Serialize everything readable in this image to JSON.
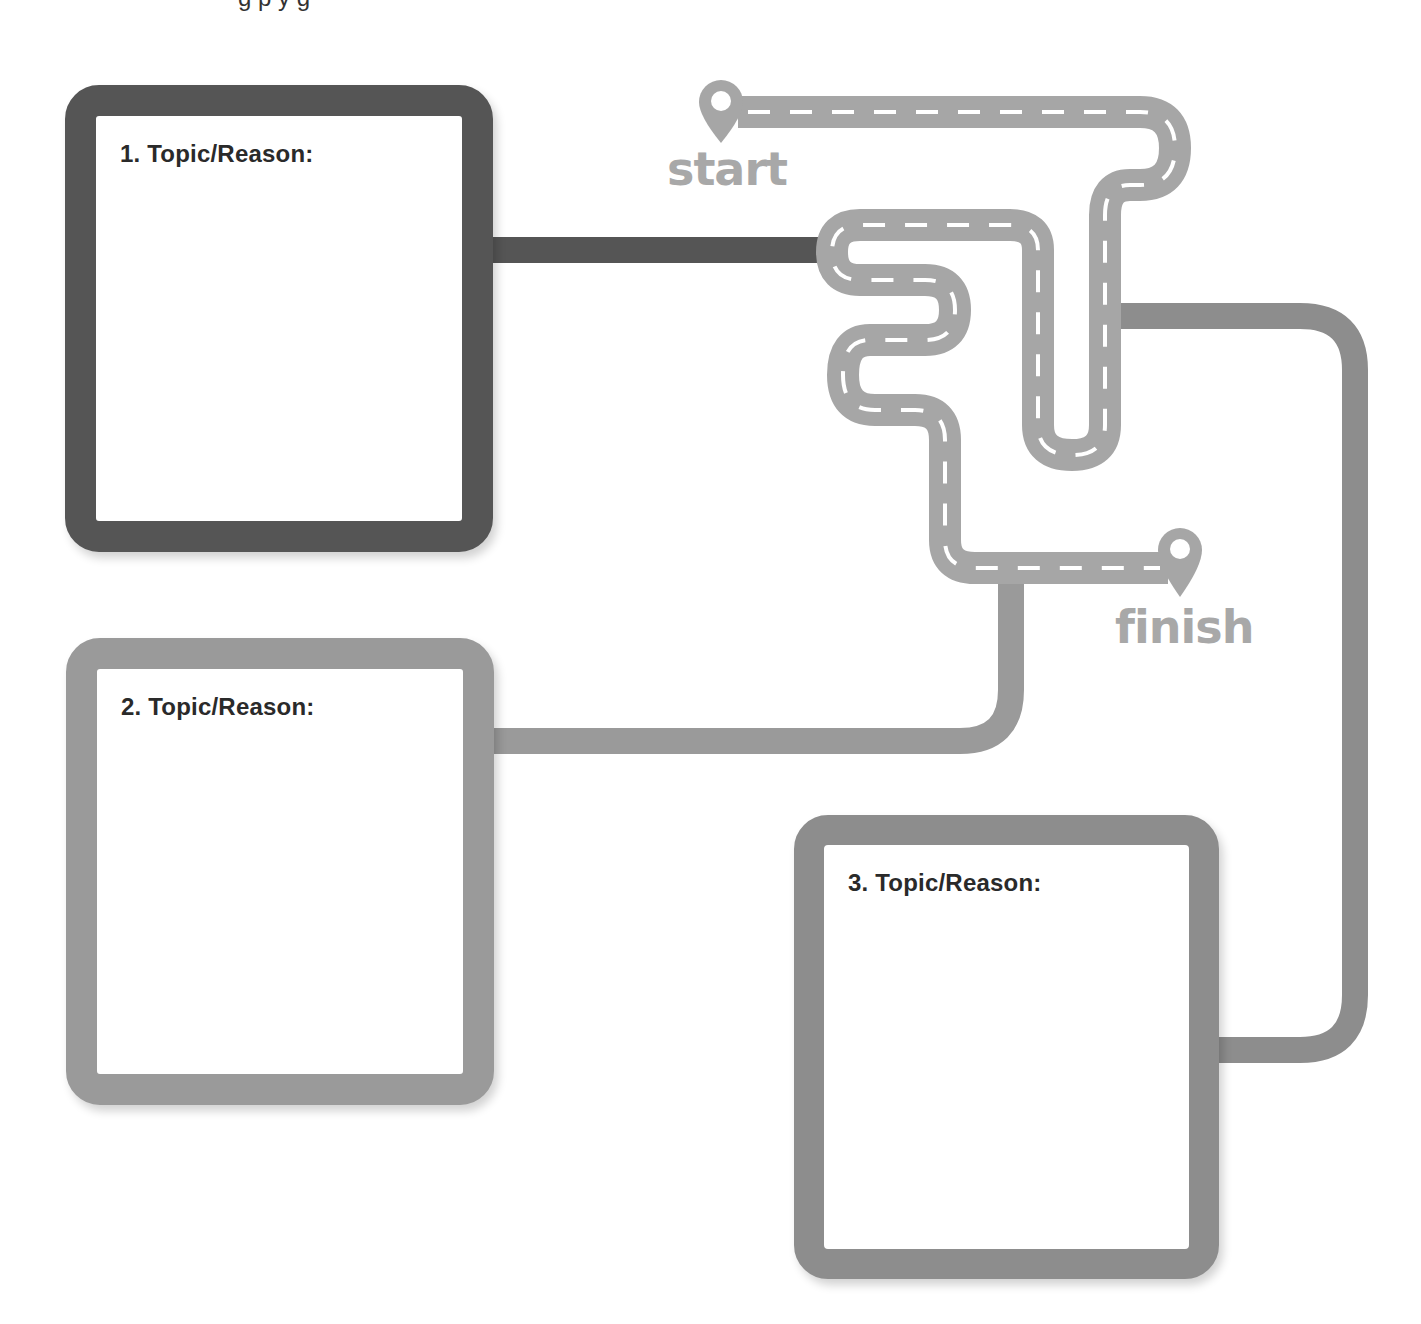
{
  "page": {
    "top_clipped_text": "g        p y          g"
  },
  "route": {
    "start_label": "start",
    "finish_label": "finish",
    "road_color": "#a6a6a6",
    "lane_marking_color": "#ffffff"
  },
  "boxes": [
    {
      "number": 1,
      "label": "1. Topic/Reason:",
      "border_color": "#555555"
    },
    {
      "number": 2,
      "label": "2. Topic/Reason:",
      "border_color": "#9a9a9a"
    },
    {
      "number": 3,
      "label": "3. Topic/Reason:",
      "border_color": "#8d8d8d"
    }
  ],
  "connectors": [
    {
      "from": "box-1",
      "to": "road",
      "color": "#555555"
    },
    {
      "from": "box-2",
      "to": "road",
      "color": "#9a9a9a"
    },
    {
      "from": "box-3",
      "to": "road",
      "color": "#8d8d8d"
    }
  ]
}
